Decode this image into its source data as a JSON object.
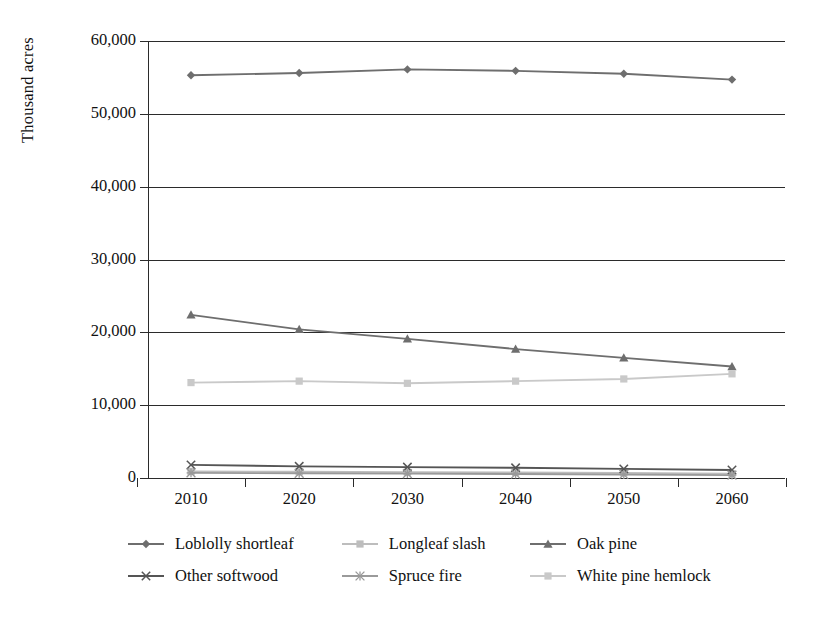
{
  "chart_data": {
    "type": "line",
    "title": "",
    "xlabel": "",
    "ylabel": "Thousand acres",
    "categories": [
      "2010",
      "2020",
      "2030",
      "2040",
      "2050",
      "2060"
    ],
    "ylim": [
      0,
      60000
    ],
    "ytick_values": [
      0,
      10000,
      20000,
      30000,
      40000,
      50000,
      60000
    ],
    "ytick_labels": [
      "0",
      "10,000",
      "20,000",
      "30,000",
      "40,000",
      "50,000",
      "60,000"
    ],
    "grid": "horizontal",
    "legend_position": "bottom",
    "series": [
      {
        "name": "Loblolly shortleaf",
        "marker": "diamond",
        "color": "#6e6e6e",
        "values": [
          55300,
          55600,
          56100,
          55900,
          55500,
          54700
        ]
      },
      {
        "name": "Longleaf slash",
        "marker": "square",
        "color": "#bdbdbd",
        "values": [
          900,
          850,
          800,
          750,
          700,
          600
        ]
      },
      {
        "name": "Oak pine",
        "marker": "triangle",
        "color": "#6e6e6e",
        "values": [
          22400,
          20400,
          19100,
          17700,
          16500,
          15300
        ]
      },
      {
        "name": "Other softwood",
        "marker": "x",
        "color": "#555555",
        "values": [
          1800,
          1600,
          1500,
          1400,
          1250,
          1100
        ]
      },
      {
        "name": "Spruce fire",
        "marker": "star",
        "color": "#9a9a9a",
        "values": [
          700,
          650,
          600,
          550,
          480,
          400
        ]
      },
      {
        "name": "White pine hemlock",
        "marker": "square",
        "color": "#c9c9c9",
        "values": [
          13100,
          13300,
          13000,
          13300,
          13600,
          14300
        ]
      }
    ]
  },
  "axis": {
    "y_title": "Thousand acres"
  },
  "legend": {
    "rows": [
      [
        {
          "label": "Loblolly shortleaf",
          "series_index": 0
        },
        {
          "label": "Longleaf slash",
          "series_index": 1
        },
        {
          "label": "Oak pine",
          "series_index": 2
        }
      ],
      [
        {
          "label": "Other softwood",
          "series_index": 3
        },
        {
          "label": "Spruce fire",
          "series_index": 4
        },
        {
          "label": "White pine hemlock",
          "series_index": 5
        }
      ]
    ]
  }
}
